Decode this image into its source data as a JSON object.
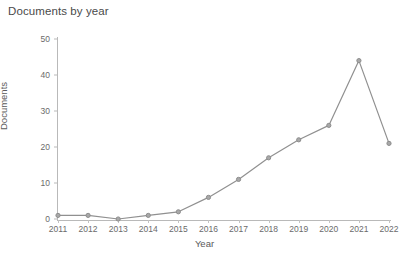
{
  "chart_data": {
    "type": "line",
    "title": "Documents by year",
    "xlabel": "Year",
    "ylabel": "Documents",
    "categories": [
      "2011",
      "2012",
      "2013",
      "2014",
      "2015",
      "2016",
      "2017",
      "2018",
      "2019",
      "2020",
      "2021",
      "2022"
    ],
    "values": [
      1,
      1,
      0,
      1,
      2,
      6,
      11,
      17,
      22,
      26,
      44,
      21
    ],
    "series": [
      {
        "name": "Documents",
        "values": [
          1,
          1,
          0,
          1,
          2,
          6,
          11,
          17,
          22,
          26,
          44,
          21
        ]
      }
    ],
    "x": [
      2011,
      2012,
      2013,
      2014,
      2015,
      2016,
      2017,
      2018,
      2019,
      2020,
      2021,
      2022
    ],
    "ylim": [
      0,
      50
    ],
    "xlim": [
      2011,
      2022
    ],
    "y_ticks": [
      0,
      10,
      20,
      30,
      40,
      50
    ],
    "x_ticks": [
      "2011",
      "2012",
      "2013",
      "2014",
      "2015",
      "2016",
      "2017",
      "2018",
      "2019",
      "2020",
      "2021",
      "2022"
    ],
    "grid": false,
    "legend": "none",
    "marker": "circle",
    "line_color": "#909090",
    "marker_color": "#8d8d8d",
    "axis_color": "#b9b9b9",
    "text_color": "#5a5a5a",
    "background_color": "#ffffff"
  }
}
